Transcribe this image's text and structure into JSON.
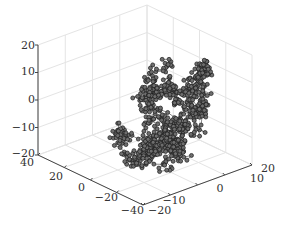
{
  "chart_data": {
    "type": "scatter3d",
    "title": "",
    "xlabel": "",
    "ylabel": "",
    "zlabel": "",
    "x_axis": {
      "ticks": [
        -20,
        -10,
        0,
        10,
        20
      ],
      "range": [
        -20,
        20
      ]
    },
    "y_axis": {
      "ticks": [
        -40,
        -20,
        0,
        20,
        40
      ],
      "range": [
        -40,
        40
      ]
    },
    "z_axis": {
      "ticks": [
        -20,
        -10,
        0,
        10,
        20
      ],
      "range": [
        -20,
        20
      ]
    },
    "grid": true,
    "legend": null,
    "marker": {
      "shape": "circle",
      "face_color": "#6e6e6e",
      "edge_color": "#1e1e1e"
    },
    "line_color": "#3a3a3a",
    "approx_point_count": 900,
    "cloud_extent": {
      "x": [
        -15,
        15
      ],
      "y": [
        -30,
        25
      ],
      "z": [
        -18,
        14
      ]
    }
  },
  "axes": {
    "z_ticks": [
      "20",
      "10",
      "0",
      "−10",
      "−20"
    ],
    "y_ticks": [
      "40",
      "20",
      "0",
      "−20",
      "−40"
    ],
    "x_ticks": [
      "−20",
      "−10",
      "0",
      "10",
      "20"
    ]
  }
}
